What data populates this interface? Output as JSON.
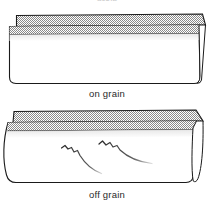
{
  "figure": {
    "title": "",
    "background_color": "#ffffff",
    "ink_color": "#1a1a1a",
    "hatch_color": "#7d7d7d",
    "shade_color": "#e8e8e8",
    "top_remnant_text": "grain",
    "panels": [
      {
        "id": "on-grain",
        "caption": "on grain",
        "description": "folded fabric lying flat and square",
        "has_ripples": false
      },
      {
        "id": "off-grain",
        "caption": "off grain",
        "description": "folded fabric with rippled distorted surface and curved edges",
        "has_ripples": true,
        "ripple_count": 2
      }
    ]
  }
}
